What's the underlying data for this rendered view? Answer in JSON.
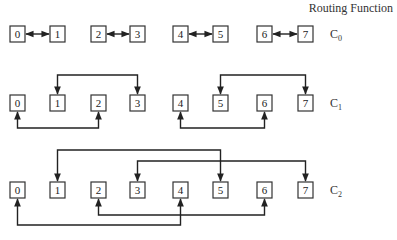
{
  "title": "Routing Function",
  "node_labels": [
    "0",
    "1",
    "2",
    "3",
    "4",
    "5",
    "6",
    "7"
  ],
  "rows": [
    {
      "label": "C",
      "subscript": "0",
      "description": "exchange with neighbor distance 1",
      "pairs": [
        [
          0,
          1
        ],
        [
          2,
          3
        ],
        [
          4,
          5
        ],
        [
          6,
          7
        ]
      ]
    },
    {
      "label": "C",
      "subscript": "1",
      "description": "exchange with distance 2",
      "pairs": [
        [
          1,
          3
        ],
        [
          5,
          7
        ],
        [
          0,
          2
        ],
        [
          4,
          6
        ]
      ]
    },
    {
      "label": "C",
      "subscript": "2",
      "description": "exchange with distance 4",
      "pairs": [
        [
          1,
          5
        ],
        [
          3,
          7
        ],
        [
          2,
          6
        ],
        [
          0,
          4
        ]
      ]
    }
  ],
  "colors": {
    "line": "#222222",
    "box": "#333333",
    "background": "#ffffff"
  }
}
